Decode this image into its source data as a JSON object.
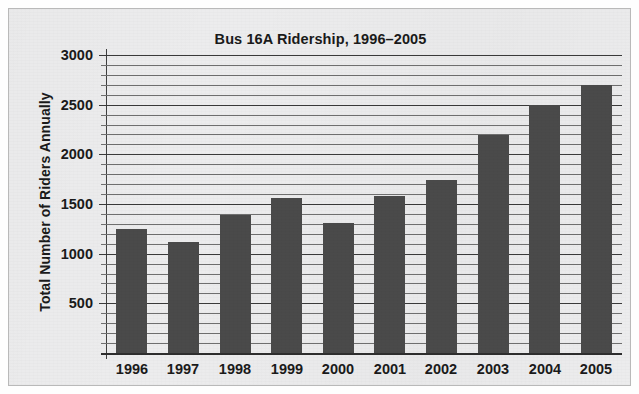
{
  "chart_data": {
    "type": "bar",
    "title": "Bus 16A Ridership, 1996–2005",
    "xlabel": "",
    "ylabel": "Total Number of Riders Annually",
    "categories": [
      "1996",
      "1997",
      "1998",
      "1999",
      "2000",
      "2001",
      "2002",
      "2003",
      "2004",
      "2005"
    ],
    "values": [
      1250,
      1120,
      1390,
      1560,
      1310,
      1580,
      1740,
      2190,
      2500,
      2700
    ],
    "ylim": [
      0,
      3000
    ],
    "y_major_ticks": [
      500,
      1000,
      1500,
      2000,
      2500,
      3000
    ],
    "y_major_tick_labels": [
      "500",
      "1000",
      "1500",
      "2000",
      "2500",
      "3000"
    ],
    "y_minor_tick_interval": 100,
    "grid": "horizontal",
    "legend": "none",
    "bar_color": "#4a4a4a",
    "grid_color": "#6f6f6f",
    "axis_color": "#2e2e2e",
    "panel_color": "#ececed",
    "text_color": "#1a1a1a"
  }
}
